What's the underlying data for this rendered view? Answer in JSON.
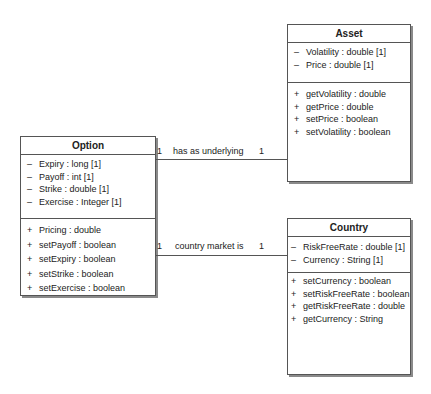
{
  "classes": {
    "asset": {
      "name": "Asset",
      "attributes": [
        {
          "vis": "–",
          "text": "Volatility : double [1]"
        },
        {
          "vis": "–",
          "text": "Price : double [1]"
        }
      ],
      "operations": [
        {
          "vis": "+",
          "text": "getVolatility : double"
        },
        {
          "vis": "+",
          "text": "getPrice : double"
        },
        {
          "vis": "+",
          "text": "setPrice : boolean"
        },
        {
          "vis": "+",
          "text": "setVolatility : boolean"
        }
      ]
    },
    "option": {
      "name": "Option",
      "attributes": [
        {
          "vis": "–",
          "text": "Expiry : long [1]"
        },
        {
          "vis": "–",
          "text": "Payoff : int [1]"
        },
        {
          "vis": "–",
          "text": "Strike : double [1]"
        },
        {
          "vis": "–",
          "text": "Exercise : Integer [1]"
        }
      ],
      "operations": [
        {
          "vis": "+",
          "text": "Pricing : double"
        },
        {
          "vis": "+",
          "text": "setPayoff : boolean"
        },
        {
          "vis": "+",
          "text": "setExpiry : boolean"
        },
        {
          "vis": "+",
          "text": "setStrike : boolean"
        },
        {
          "vis": "+",
          "text": "setExercise : boolean"
        }
      ]
    },
    "country": {
      "name": "Country",
      "attributes": [
        {
          "vis": "–",
          "text": "RiskFreeRate : double [1]"
        },
        {
          "vis": "–",
          "text": "Currency : String [1]"
        }
      ],
      "operations": [
        {
          "vis": "+",
          "text": "setCurrency : boolean"
        },
        {
          "vis": "+",
          "text": "setRiskFreeRate : boolean"
        },
        {
          "vis": "+",
          "text": "getRiskFreeRate : double"
        },
        {
          "vis": "+",
          "text": "getCurrency : String"
        }
      ]
    }
  },
  "associations": [
    {
      "name": "has as underlying",
      "source_mult": "1",
      "target_mult": "1"
    },
    {
      "name": "country market is",
      "source_mult": "1",
      "target_mult": "1"
    }
  ]
}
